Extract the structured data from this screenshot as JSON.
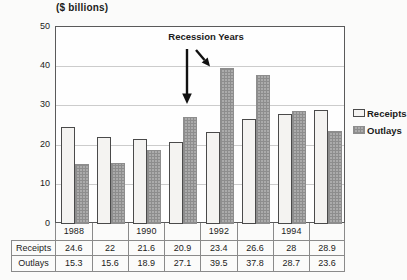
{
  "chart_data": {
    "type": "bar",
    "title": "($ billions)",
    "annotation": "Recession Years",
    "categories": [
      "1988",
      "1989",
      "1990",
      "1991",
      "1992",
      "1993",
      "1994",
      "1995"
    ],
    "x_axis_labels": [
      "1988",
      "",
      "1990",
      "",
      "1992",
      "",
      "1994",
      ""
    ],
    "series": [
      {
        "name": "Receipts",
        "values": [
          24.6,
          22,
          21.6,
          20.9,
          23.4,
          26.6,
          28,
          28.9
        ],
        "color_hint": "#f4f3f1"
      },
      {
        "name": "Outlays",
        "values": [
          15.3,
          15.6,
          18.9,
          27.1,
          39.5,
          37.8,
          28.7,
          23.6
        ],
        "color_hint": "#ababab",
        "pattern": "checker"
      }
    ],
    "ylim": [
      0,
      50
    ],
    "yticks": [
      0,
      10,
      20,
      30,
      40,
      50
    ],
    "grid": true,
    "legend_position": "right",
    "table": {
      "row_labels": [
        "Receipts",
        "Outlays"
      ]
    }
  }
}
